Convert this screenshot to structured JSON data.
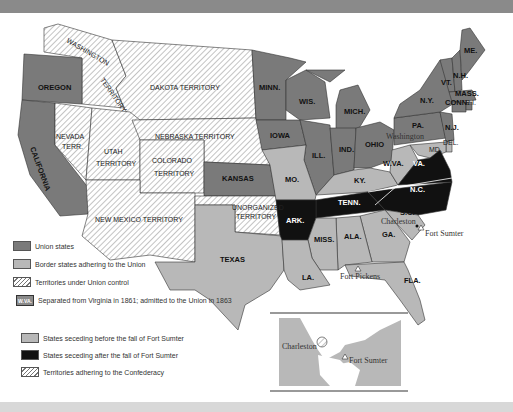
{
  "map": {
    "colors": {
      "union": "#7a7a7a",
      "border": "#b8b8b8",
      "seceding_before": "#b8b8b8",
      "seceding_after": "#111111",
      "territory_stripe": "#777777",
      "background": "#ffffff"
    },
    "territories": {
      "washington": "WASHINGTON",
      "washington2": "TERRITORY",
      "dakota": "DAKOTA TERRITORY",
      "nevada": "NEVADA",
      "nevada2": "TERR.",
      "utah": "UTAH",
      "utah2": "TERRITORY",
      "nebraska": "NEBRASKA TERRITORY",
      "colorado": "COLORADO",
      "colorado2": "TERRITORY",
      "new_mexico": "NEW MEXICO TERRITORY",
      "unorganized": "UNORGANIZED",
      "unorganized2": "TERRITORY"
    },
    "states": {
      "oregon": "OREGON",
      "california": "CALIFORNIA",
      "minn": "MINN.",
      "wis": "WIS.",
      "mich": "MICH.",
      "iowa": "IOWA",
      "ill": "ILL.",
      "ind": "IND.",
      "ohio": "OHIO",
      "kansas": "KANSAS",
      "mo": "MO.",
      "ky": "KY.",
      "wva": "W.VA.",
      "va": "VA.",
      "nc": "N.C.",
      "tenn": "TENN.",
      "ark": "ARK.",
      "sc": "S.C.",
      "ga": "GA.",
      "ala": "ALA.",
      "miss": "MISS.",
      "la": "LA.",
      "texas": "TEXAS",
      "fla": "FLA.",
      "pa": "PA.",
      "ny": "N.Y.",
      "me": "ME.",
      "vt": "VT.",
      "nh": "N.H.",
      "mass": "MASS.",
      "conn": "CONN.",
      "ri": "R.I.",
      "nj": "N.J.",
      "del": "DEL.",
      "md": "MD."
    },
    "places": {
      "washington_city": "Washington",
      "charleston": "Charleston",
      "fort_sumter": "Fort Sumter",
      "fort_pickens": "Fort Pickens"
    }
  },
  "inset": {
    "charleston": "Charleston",
    "fort_sumter": "Fort Sumter"
  },
  "legend": {
    "union_states": "Union states",
    "border_states": "Border states adhering to the Union",
    "territories_union": "Territories under Union control",
    "wva_badge": "W.VA.",
    "wva_note": "Separated from Virginia in 1861; admitted to the Union in 1863",
    "seceding_before": "States seceding before the fall of Fort Sumter",
    "seceding_after": "States seceding after the fall of Fort Sumter",
    "territories_confederacy": "Territories adhering to the Confederacy"
  }
}
